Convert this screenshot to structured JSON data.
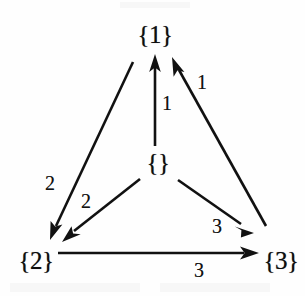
{
  "diagram": {
    "kind": "directed-graph",
    "background_color": "#fefefe",
    "stroke_color": "#111111",
    "nodes": [
      {
        "id": "n1",
        "label": "{1}",
        "x": 155,
        "y": 35
      },
      {
        "id": "empty",
        "label": "{}",
        "x": 158,
        "y": 163
      },
      {
        "id": "n2",
        "label": "{2}",
        "x": 36,
        "y": 261
      },
      {
        "id": "n3",
        "label": "{3}",
        "x": 281,
        "y": 261
      }
    ],
    "edges": [
      {
        "id": "e-empty-1",
        "from": "empty",
        "to": "n1",
        "label": "1",
        "label_x": 167,
        "label_y": 103
      },
      {
        "id": "e-3-1",
        "from": "n3",
        "to": "n1",
        "label": "1",
        "label_x": 202,
        "label_y": 82
      },
      {
        "id": "e-1-2",
        "from": "n1",
        "to": "n2",
        "label": "2",
        "label_x": 50,
        "label_y": 183
      },
      {
        "id": "e-empty-2",
        "from": "empty",
        "to": "n2",
        "label": "2",
        "label_x": 86,
        "label_y": 201
      },
      {
        "id": "e-empty-3",
        "from": "empty",
        "to": "n3",
        "label": "3",
        "label_x": 217,
        "label_y": 226
      },
      {
        "id": "e-2-3",
        "from": "n2",
        "to": "n3",
        "label": "3",
        "label_x": 199,
        "label_y": 270
      }
    ]
  }
}
